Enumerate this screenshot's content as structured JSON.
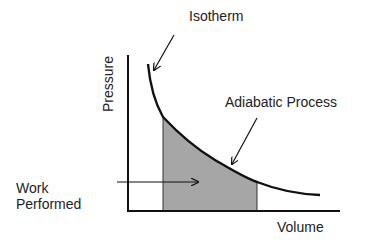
{
  "diagram": {
    "axes": {
      "x_label": "Volume",
      "y_label": "Pressure"
    },
    "labels": {
      "isotherm": "Isotherm",
      "adiabatic": "Adiabatic Process",
      "work_line1": "Work",
      "work_line2": "Performed"
    },
    "colors": {
      "line": "#111111",
      "fill": "#a6a6a6",
      "text": "#222222",
      "background": "#ffffff"
    },
    "curve": {
      "type": "hyperbolic P-V curve",
      "shaded_region": "area under curve between two volumes (work performed)"
    }
  }
}
